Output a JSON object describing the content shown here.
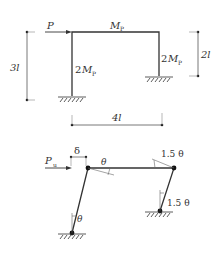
{
  "figure": {
    "top": {
      "load_label": "P",
      "beam_moment": "M",
      "beam_moment_sub": "P",
      "left_col_coef": "2",
      "left_col_moment": "M",
      "left_col_sub": "P",
      "right_col_coef": "2",
      "right_col_moment": "M",
      "right_col_sub": "P",
      "left_height": "3l",
      "right_height": "2l",
      "span": "4l"
    },
    "bottom": {
      "load_label": "P",
      "load_sub": "u",
      "sway": "δ",
      "theta_beam_left": "θ",
      "theta_beam_right": "1.5 θ",
      "theta_col_left": "θ",
      "theta_col_right": "1.5 θ"
    }
  }
}
